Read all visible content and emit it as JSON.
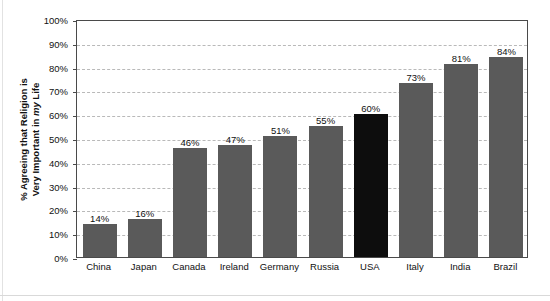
{
  "chart_data": {
    "type": "bar",
    "title": "",
    "xlabel": "",
    "ylabel": "% Agreeing that Religion is Very Important in my Life",
    "ylabel_line1": "% Agreeing that Religion is",
    "ylabel_line2_pre": "Very Important in ",
    "ylabel_line2_em": "my",
    "ylabel_line2_post": " Life",
    "categories": [
      "China",
      "Japan",
      "Canada",
      "Ireland",
      "Germany",
      "Russia",
      "USA",
      "Italy",
      "India",
      "Brazil"
    ],
    "values": [
      14,
      16,
      46,
      47,
      51,
      55,
      60,
      73,
      81,
      84
    ],
    "data_labels": [
      "14%",
      "16%",
      "46%",
      "47%",
      "51%",
      "55%",
      "60%",
      "73%",
      "81%",
      "84%"
    ],
    "highlight_category": "USA",
    "ylim": [
      0,
      100
    ],
    "ytick_values": [
      0,
      10,
      20,
      30,
      40,
      50,
      60,
      70,
      80,
      90,
      100
    ],
    "ytick_labels": [
      "0%",
      "10%",
      "20%",
      "30%",
      "40%",
      "50%",
      "60%",
      "70%",
      "80%",
      "90%",
      "100%"
    ],
    "grid": true,
    "grid_axis": "y",
    "legend": false,
    "bar_color": "#5a5a5a",
    "highlight_color": "#0d0d0d",
    "grid_color": "#b9b9b9",
    "axis_color": "#4a4a4a",
    "background_color": "#ffffff",
    "text_color": "#111111"
  }
}
